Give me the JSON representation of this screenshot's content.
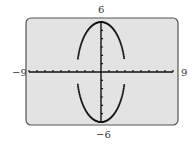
{
  "chart_data": {
    "type": "line",
    "title": "",
    "window": {
      "xmin": -9,
      "xmax": 9,
      "ymin": -6,
      "ymax": 6,
      "xscl": 1,
      "yscl": 1
    },
    "xlim": [
      -9,
      9
    ],
    "ylim": [
      -6,
      6
    ],
    "tick_labels": {
      "top": "6",
      "bottom": "−6",
      "left": "−9",
      "right": "9"
    },
    "series": [
      {
        "name": "upper half",
        "equation": "y = 2*sqrt(9 - x^2)",
        "x_range": [
          -3,
          3
        ]
      },
      {
        "name": "lower half",
        "equation": "y = -2*sqrt(9 - x^2)",
        "x_range": [
          -3,
          3
        ]
      }
    ],
    "grid": false
  },
  "labels": {
    "ymax": "6",
    "ymin": "−6",
    "xmin": "−9",
    "xmax": "9"
  },
  "colors": {
    "screen_bg": "#e3e3e3",
    "border": "#555555",
    "curve": "#111111"
  }
}
